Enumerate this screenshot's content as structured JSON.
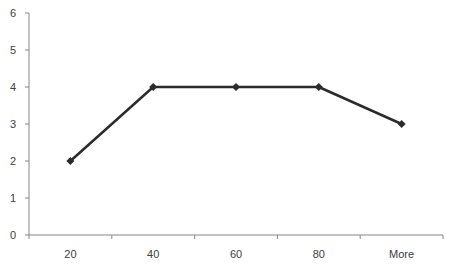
{
  "chart_data": {
    "type": "line",
    "title": "",
    "xlabel": "",
    "ylabel": "",
    "categories": [
      "20",
      "40",
      "60",
      "80",
      "More"
    ],
    "series": [
      {
        "name": "Frequency",
        "values": [
          2,
          4,
          4,
          4,
          3
        ],
        "color": "#2b2b2b",
        "marker": "diamond"
      }
    ],
    "ylim": [
      0,
      6
    ],
    "yticks": [
      "0",
      "1",
      "2",
      "3",
      "4",
      "5",
      "6"
    ],
    "grid": false,
    "legend": "none"
  }
}
